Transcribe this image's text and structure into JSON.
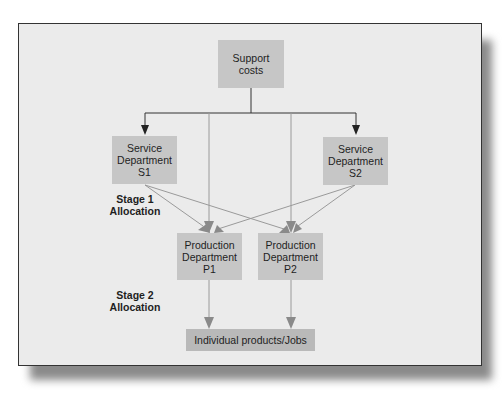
{
  "diagram": {
    "nodes": {
      "support": {
        "text": "Support\ncosts"
      },
      "s1": {
        "text": "Service\nDepartment\nS1"
      },
      "s2": {
        "text": "Service\nDepartment\nS2"
      },
      "p1": {
        "text": "Production\nDepartment\nP1"
      },
      "p2": {
        "text": "Production\nDepartment\nP2"
      },
      "products": {
        "text": "Individual products/Jobs"
      }
    },
    "labels": {
      "stage1": "Stage 1\nAllocation",
      "stage2": "Stage 2\nAllocation"
    },
    "edges": [
      {
        "from": "support",
        "to": "s1"
      },
      {
        "from": "support",
        "to": "s2"
      },
      {
        "from": "support",
        "to": "p1"
      },
      {
        "from": "support",
        "to": "p2"
      },
      {
        "from": "s1",
        "to": "p1"
      },
      {
        "from": "s1",
        "to": "p2"
      },
      {
        "from": "s2",
        "to": "p1"
      },
      {
        "from": "s2",
        "to": "p2"
      },
      {
        "from": "p1",
        "to": "products"
      },
      {
        "from": "p2",
        "to": "products"
      }
    ],
    "colors": {
      "background": "#ebebeb",
      "box": "#c6c6c6",
      "primary_arrow": "#222222",
      "secondary_arrow": "#8a8a8a"
    }
  }
}
